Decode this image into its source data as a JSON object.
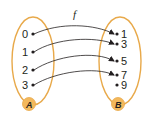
{
  "diagram": {
    "function_label": "f",
    "colors": {
      "oval_stroke": "#e8a94a",
      "badge_fill": "#f3b85c",
      "arrow": "#231f20",
      "text": "#231f20"
    },
    "set_a": {
      "name": "A",
      "elements": [
        "0",
        "1",
        "2",
        "3"
      ]
    },
    "set_b": {
      "name": "B",
      "elements": [
        "1",
        "3",
        "5",
        "7",
        "9"
      ]
    },
    "mapping": [
      {
        "from": "0",
        "to": "1"
      },
      {
        "from": "1",
        "to": "3"
      },
      {
        "from": "2",
        "to": "5"
      },
      {
        "from": "3",
        "to": "7"
      }
    ]
  }
}
